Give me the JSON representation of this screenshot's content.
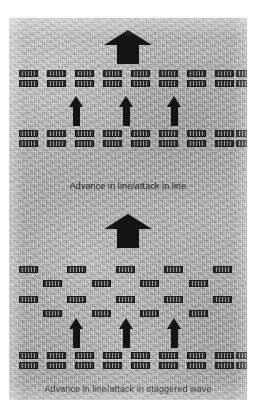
{
  "figure": {
    "background_color": "#b9b9b9",
    "unit_color": "#2b2b2b",
    "arrow_color": "#141414",
    "text_color": "#1c1c1c"
  },
  "panels": [
    {
      "id": "advance-in-line-attack-in-line",
      "caption": "Advance in line/attack in line",
      "main_arrow": {
        "label": "main-advance-arrow",
        "direction": "up",
        "x": 95,
        "y": 12,
        "w": 48,
        "h": 34
      },
      "small_arrows": [
        {
          "label": "attack-arrow-left",
          "direction": "up",
          "x": 60,
          "y": 78
        },
        {
          "label": "attack-arrow-center",
          "direction": "up",
          "x": 110,
          "y": 78
        },
        {
          "label": "attack-arrow-right",
          "direction": "up",
          "x": 158,
          "y": 78
        }
      ],
      "formations": [
        {
          "name": "front-line-formation",
          "style": "line",
          "rows": [
            {
              "y": 52,
              "xs": [
                10,
                38,
                66,
                94,
                122,
                150,
                178,
                206,
                227
              ]
            },
            {
              "y": 62,
              "xs": [
                10,
                38,
                66,
                94,
                122,
                150,
                178,
                206,
                227
              ]
            }
          ]
        },
        {
          "name": "rear-line-formation",
          "style": "line",
          "rows": [
            {
              "y": 112,
              "xs": [
                10,
                38,
                66,
                94,
                122,
                150,
                178,
                206,
                227
              ]
            },
            {
              "y": 122,
              "xs": [
                10,
                38,
                66,
                94,
                122,
                150,
                178,
                206,
                227
              ]
            }
          ]
        }
      ]
    },
    {
      "id": "advance-in-line-attack-in-staggered-wave",
      "caption": "Advance in line/attack in staggered wave",
      "main_arrow": {
        "label": "main-advance-arrow",
        "direction": "up",
        "x": 95,
        "y": 6,
        "w": 48,
        "h": 34
      },
      "small_arrows": [
        {
          "label": "attack-arrow-left",
          "direction": "up",
          "x": 60,
          "y": 110
        },
        {
          "label": "attack-arrow-center",
          "direction": "up",
          "x": 110,
          "y": 110
        },
        {
          "label": "attack-arrow-right",
          "direction": "up",
          "x": 158,
          "y": 110
        }
      ],
      "formations": [
        {
          "name": "staggered-wave-formation",
          "style": "staggered",
          "rows": [
            {
              "y": 58,
              "xs": [
                10,
                58,
                107,
                155,
                204
              ]
            },
            {
              "y": 72,
              "xs": [
                34,
                83,
                131,
                180
              ]
            },
            {
              "y": 88,
              "xs": [
                10,
                58,
                107,
                155,
                204
              ]
            },
            {
              "y": 102,
              "xs": [
                34,
                83,
                131,
                180
              ]
            }
          ]
        },
        {
          "name": "reserve-line-formation",
          "style": "line",
          "rows": [
            {
              "y": 144,
              "xs": [
                10,
                38,
                66,
                94,
                122,
                150,
                178,
                206,
                227
              ]
            },
            {
              "y": 154,
              "xs": [
                10,
                38,
                66,
                94,
                122,
                150,
                178,
                206,
                227
              ]
            }
          ]
        }
      ]
    }
  ],
  "captions": {
    "top": "Advance in line/attack in line",
    "bottom": "Advance in line/attack in staggered wave"
  },
  "caption_positions": {
    "top_y": 163,
    "bottom_y": 176
  }
}
